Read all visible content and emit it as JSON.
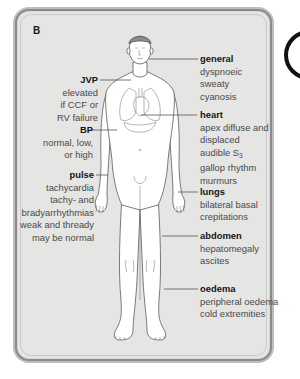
{
  "panel": {
    "letter": "B",
    "background_color": "#e5e5e3",
    "border_color": "#8a8a8a"
  },
  "labels": {
    "general": {
      "title": "general",
      "lines": [
        "dyspnoeic",
        "sweaty",
        "cyanosis"
      ]
    },
    "jvp": {
      "title": "JVP",
      "lines": [
        "elevated",
        "if CCF or",
        "RV failure"
      ]
    },
    "heart": {
      "title": "heart",
      "lines": [
        "apex diffuse and",
        "displaced",
        "audible S",
        "gallop rhythm",
        "murmurs"
      ],
      "s3_subscript": "3"
    },
    "bp": {
      "title": "BP",
      "lines": [
        "normal, low,",
        "or high"
      ]
    },
    "pulse": {
      "title": "pulse",
      "lines": [
        "tachycardia",
        "tachy- and",
        "bradyarrhythmias",
        "weak and thready",
        "may be normal"
      ]
    },
    "lungs": {
      "title": "lungs",
      "lines": [
        "bilateral basal",
        "crepitations"
      ]
    },
    "abdomen": {
      "title": "abdomen",
      "lines": [
        "hepatomegaly",
        "ascites"
      ]
    },
    "oedema": {
      "title": "oedema",
      "lines": [
        "peripheral oedema",
        "cold extremities"
      ]
    }
  },
  "figure": {
    "stroke_color": "#555555",
    "fill_color": "#ffffff"
  }
}
